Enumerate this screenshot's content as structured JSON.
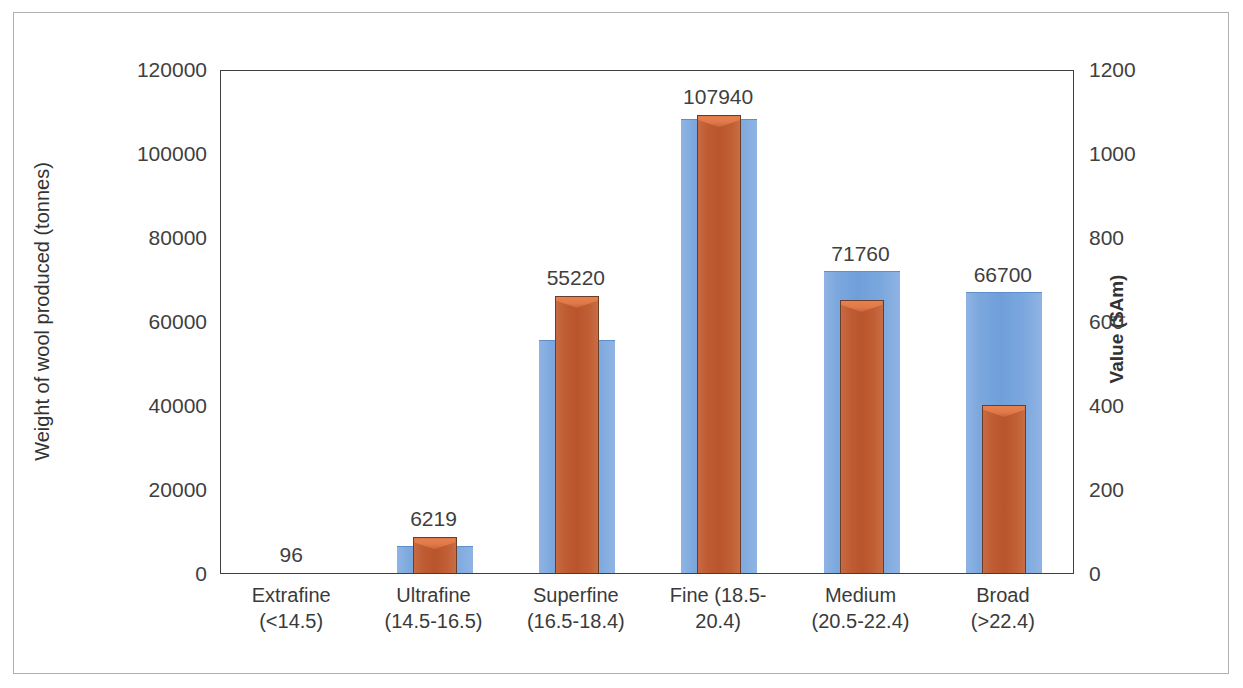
{
  "chart_data": {
    "type": "bar",
    "title": "",
    "subtitle": "",
    "xlabel": "",
    "categories": [
      "Extrafine (<14.5)",
      "Ultrafine (14.5-16.5)",
      "Superfine (16.5-18.4)",
      "Fine (18.5-20.4)",
      "Medium (20.5-22.4)",
      "Broad (>22.4)"
    ],
    "category_lines": [
      {
        "line1": "Extrafine",
        "line2": "(<14.5)"
      },
      {
        "line1": "Ultrafine",
        "line2": "(14.5-16.5)"
      },
      {
        "line1": "Superfine",
        "line2": "(16.5-18.4)"
      },
      {
        "line1": "Fine (18.5-",
        "line2": "20.4)"
      },
      {
        "line1": "Medium",
        "line2": "(20.5-22.4)"
      },
      {
        "line1": "Broad",
        "line2": "(>22.4)"
      }
    ],
    "series": [
      {
        "name": "Weight of wool produced (tonnes)",
        "axis": "left",
        "color": "#7ba7dd",
        "values": [
          96,
          6219,
          55220,
          107940,
          71760,
          66700
        ],
        "labels": [
          "96",
          "6219",
          "55220",
          "107940",
          "71760",
          "66700"
        ]
      },
      {
        "name": "Value ($Am)",
        "axis": "right",
        "color": "#bf5c33",
        "values": [
          0,
          85,
          660,
          1090,
          650,
          400
        ],
        "labels": [
          "",
          "",
          "",
          "",
          "",
          ""
        ]
      }
    ],
    "ylabel": "Weight of wool produced (tonnes)",
    "ylabel_secondary": "Value ($Am)",
    "ylim": [
      0,
      120000
    ],
    "ylim_secondary": [
      0,
      1200
    ],
    "yticks": [
      0,
      20000,
      40000,
      60000,
      80000,
      100000,
      120000
    ],
    "ytick_labels": [
      "0",
      "20000",
      "40000",
      "60000",
      "80000",
      "100000",
      "120000"
    ],
    "yticks_secondary": [
      0,
      200,
      400,
      600,
      800,
      1000,
      1200
    ],
    "ytick_labels_secondary": [
      "0",
      "200",
      "400",
      "600",
      "800",
      "1000",
      "1200"
    ],
    "grid": false,
    "legend": "none",
    "data_label_color": "#3f3f3f"
  }
}
